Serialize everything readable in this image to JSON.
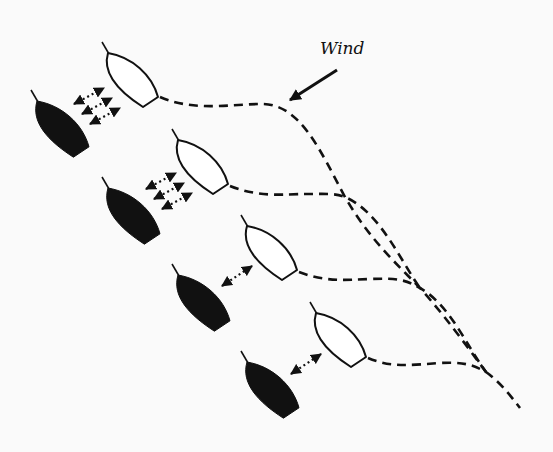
{
  "diagram": {
    "background": "#fafafa",
    "ink": "#111111",
    "wind": {
      "label": "Wind",
      "arrow": {
        "from": [
          337,
          70
        ],
        "to": [
          290,
          100
        ]
      }
    },
    "white_boats": [
      {
        "id": "white-boat-1",
        "bow": [
          108,
          53
        ]
      },
      {
        "id": "white-boat-2",
        "bow": [
          178,
          140
        ]
      },
      {
        "id": "white-boat-3",
        "bow": [
          247,
          226
        ]
      },
      {
        "id": "white-boat-4",
        "bow": [
          316,
          313
        ]
      }
    ],
    "black_boats": [
      {
        "id": "black-boat-1",
        "bow": [
          37,
          101
        ]
      },
      {
        "id": "black-boat-2",
        "bow": [
          108,
          188
        ]
      },
      {
        "id": "black-boat-3",
        "bow": [
          178,
          275
        ]
      },
      {
        "id": "black-boat-4",
        "bow": [
          247,
          362
        ]
      }
    ],
    "interaction_arrows": [
      {
        "pair": 1,
        "count": 3,
        "arrows": [
          [
            [
              74,
              104
            ],
            [
              104,
              88
            ]
          ],
          [
            [
              82,
              114
            ],
            [
              112,
              98
            ]
          ],
          [
            [
              90,
              124
            ],
            [
              120,
              108
            ]
          ]
        ]
      },
      {
        "pair": 2,
        "count": 3,
        "arrows": [
          [
            [
              146,
              189
            ],
            [
              176,
              173
            ]
          ],
          [
            [
              154,
              199
            ],
            [
              184,
              183
            ]
          ],
          [
            [
              162,
              209
            ],
            [
              192,
              193
            ]
          ]
        ]
      },
      {
        "pair": 3,
        "count": 1,
        "arrows": [
          [
            [
              222,
              286
            ],
            [
              252,
              266
            ]
          ]
        ]
      },
      {
        "pair": 4,
        "count": 1,
        "arrows": [
          [
            [
              291,
              374
            ],
            [
              321,
              354
            ]
          ]
        ]
      }
    ],
    "wake_paths": [
      {
        "id": "wake-1",
        "d": "M160,97 C195,112 230,104 262,104 C300,104 320,150 345,197 C370,240 395,262 420,288 C445,316 466,345 486,372"
      },
      {
        "id": "wake-2",
        "d": "M230,186 C260,198 285,194 305,194 C325,194 335,193 345,197 C380,212 400,260 420,288"
      },
      {
        "id": "wake-3",
        "d": "M299,272 C325,282 345,280 370,279 C395,278 405,279 420,288 C450,305 466,345 486,372"
      },
      {
        "id": "wake-4",
        "d": "M368,358 C392,368 410,365 440,363 C462,362 472,364 486,372 C500,382 510,395 520,408"
      }
    ]
  }
}
